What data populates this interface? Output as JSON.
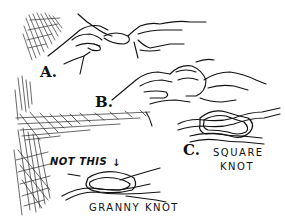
{
  "illustration": {
    "subject": "Tying a square knot",
    "style": "pen-and-ink line drawing",
    "ink_color": "#111111",
    "paper_color": "#ffffff",
    "steps": [
      {
        "label": "A.",
        "description": "two hands crossing rope ends"
      },
      {
        "label": "B.",
        "description": "two hands tucking rope ends into loop"
      },
      {
        "label": "C.",
        "description": "finished knot"
      }
    ],
    "square_knot": {
      "step_label": "C.",
      "caption_line1": "SQUARE",
      "caption_line2": "KNOT"
    },
    "granny_knot": {
      "warning": "NOT THIS",
      "arrow": "↓",
      "caption": "GRANNY KNOT"
    }
  }
}
